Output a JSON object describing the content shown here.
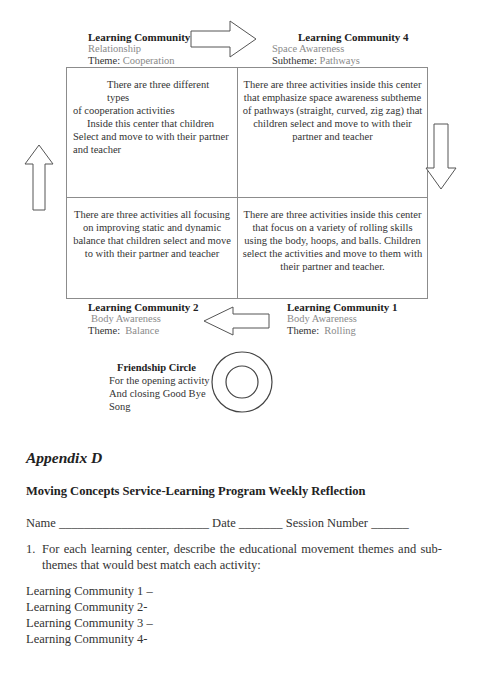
{
  "diagram": {
    "communities": {
      "lc3": {
        "title": "Learning Community 3",
        "category": "Relationship",
        "theme_label": "Theme:",
        "theme_value": "Cooperation",
        "description_line1": "There are three different types",
        "description_line2": "of cooperation activities",
        "description_line3": "Inside this center that children",
        "description_line4": "Select and move to with their partner",
        "description_line5": "and teacher"
      },
      "lc4": {
        "title": "Learning Community 4",
        "category": "Space Awareness",
        "theme_label": "Subtheme:",
        "theme_value": "Pathways",
        "description": "There are three activities inside this center that emphasize space awareness subtheme of pathways (straight, curved, zig zag) that children select and move to with their partner and teacher"
      },
      "lc2": {
        "title": "Learning Community 2",
        "category": "Body Awareness",
        "theme_label": "Theme:",
        "theme_value": "Balance",
        "description": "There are three activities all focusing on improving static and dynamic balance that children select and move to with their partner and teacher"
      },
      "lc1": {
        "title": "Learning Community 1",
        "category": "Body Awareness",
        "theme_label": "Theme:",
        "theme_value": "Rolling",
        "description": "There are three activities inside this center that focus on a variety of rolling skills using the body, hoops, and balls.  Children select the activities and move to them with their partner and teacher."
      }
    },
    "friendship_circle": {
      "title": "Friendship Circle",
      "line1": "For the opening activity",
      "line2": "And closing Good Bye",
      "line3": "Song"
    },
    "arrows": [
      "arrow-right",
      "arrow-down",
      "arrow-left",
      "arrow-up"
    ]
  },
  "appendix": {
    "heading": "Appendix D",
    "form_title": "Moving Concepts Service-Learning Program Weekly Reflection",
    "fields": {
      "name_label": "Name",
      "name_blank": "________________________",
      "date_label": "Date",
      "date_blank": "_______",
      "session_label": "Session Number",
      "session_blank": "______"
    },
    "question_number": "1.",
    "question_text": "For each learning center, describe the educational movement themes and sub-themes that would best match each activity:",
    "answers": [
      "Learning Community 1 –",
      "Learning Community 2-",
      "Learning Community 3 –",
      "Learning Community 4-"
    ]
  }
}
